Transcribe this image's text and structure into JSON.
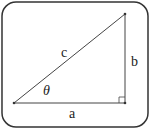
{
  "diagram": {
    "type": "right-triangle",
    "frame": {
      "rounded": true,
      "stroke": "#333333"
    },
    "vertices": {
      "bottom_left": [
        14,
        103
      ],
      "bottom_right": [
        125,
        103
      ],
      "top_right": [
        125,
        14
      ]
    },
    "labels": {
      "hypotenuse": "c",
      "vertical_leg": "b",
      "horizontal_leg": "a",
      "angle": "θ"
    },
    "right_angle_marker": true,
    "line_color": "#333333"
  }
}
